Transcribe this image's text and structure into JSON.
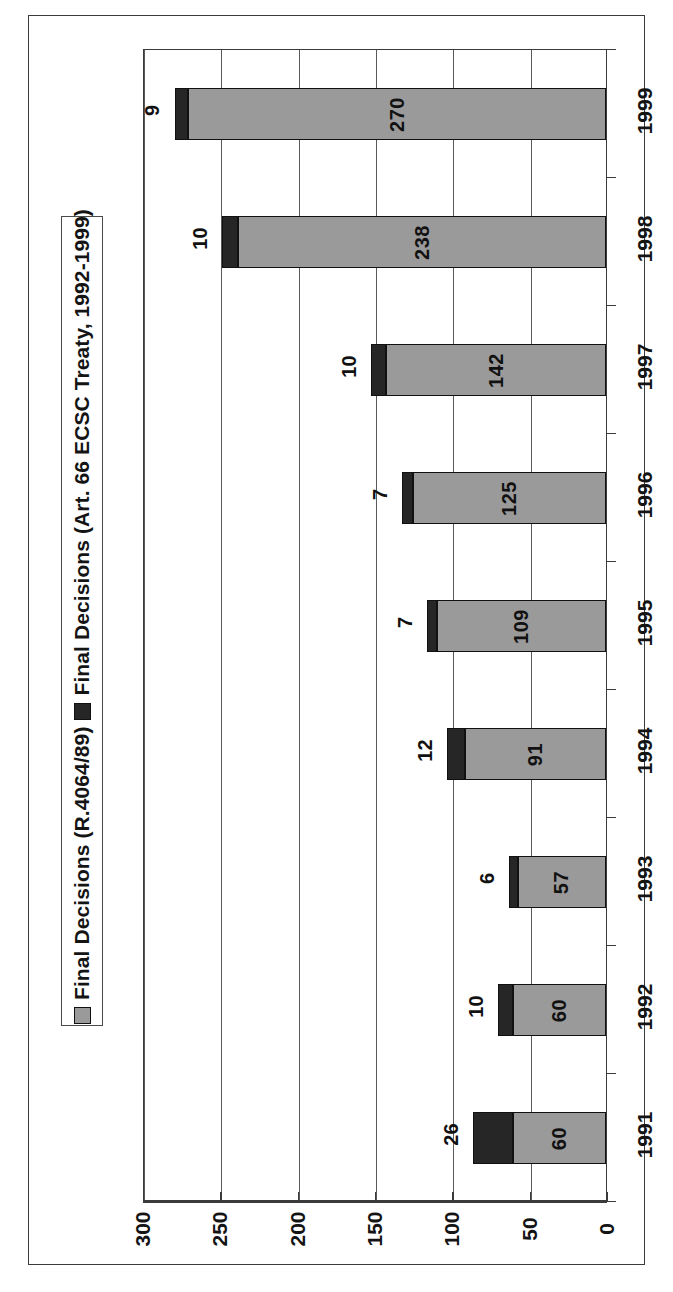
{
  "chart_data": {
    "type": "bar",
    "orientation": "horizontal",
    "stacked": true,
    "title": "",
    "xlabel": "",
    "ylabel": "",
    "categories": [
      "1991",
      "1992",
      "1993",
      "1994",
      "1995",
      "1996",
      "1997",
      "1998",
      "1999"
    ],
    "series": [
      {
        "name": "Final Decisions (R.4064/89)",
        "color": "#9a9a9a",
        "values": [
          60,
          60,
          57,
          91,
          109,
          125,
          142,
          238,
          270
        ]
      },
      {
        "name": "Final Decisions (Art. 66 ECSC Treaty, 1992-1999)",
        "color": "#262626",
        "values": [
          26,
          10,
          6,
          12,
          7,
          7,
          10,
          10,
          9
        ]
      }
    ],
    "totals": [
      86,
      70,
      63,
      103,
      116,
      132,
      152,
      248,
      279
    ],
    "value_axis": {
      "min": 0,
      "max": 300,
      "tick_step": 50,
      "ticks": [
        "300",
        "250",
        "200",
        "150",
        "100",
        "50",
        "0"
      ],
      "direction": "reversed"
    },
    "grid": true,
    "legend_position": "left"
  },
  "legend": {
    "entries": [
      {
        "label": "Final Decisions (R.4064/89)",
        "swatch": "primary"
      },
      {
        "label": "Final Decisions (Art. 66 ECSC Treaty, 1992-1999)",
        "swatch": "secondary"
      }
    ]
  },
  "axis": {
    "value_ticks": [
      "300",
      "250",
      "200",
      "150",
      "100",
      "50",
      "0"
    ],
    "category_ticks": [
      "1999",
      "1998",
      "1997",
      "1996",
      "1995",
      "1994",
      "1993",
      "1992",
      "1991"
    ]
  },
  "bars": [
    {
      "year": "1999",
      "primary": 270,
      "secondary": 9
    },
    {
      "year": "1998",
      "primary": 238,
      "secondary": 10
    },
    {
      "year": "1997",
      "primary": 142,
      "secondary": 10
    },
    {
      "year": "1996",
      "primary": 125,
      "secondary": 7
    },
    {
      "year": "1995",
      "primary": 109,
      "secondary": 7
    },
    {
      "year": "1994",
      "primary": 91,
      "secondary": 12
    },
    {
      "year": "1993",
      "primary": 57,
      "secondary": 6
    },
    {
      "year": "1992",
      "primary": 60,
      "secondary": 10
    },
    {
      "year": "1991",
      "primary": 60,
      "secondary": 26
    }
  ]
}
